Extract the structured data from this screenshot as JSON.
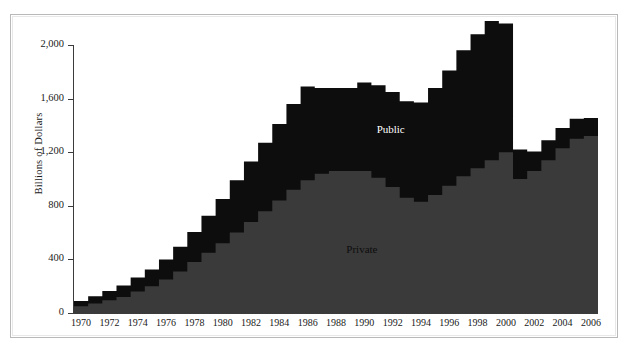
{
  "chart_data": {
    "type": "area",
    "title": "",
    "subtitle": "",
    "xlabel": "",
    "ylabel": "Billions of Dollars",
    "xlim": [
      1970,
      2006
    ],
    "ylim": [
      0,
      2000
    ],
    "grid": false,
    "legend_position": "inline-annotations",
    "stacked": true,
    "step": true,
    "colors": {
      "private": "#3a3a3a",
      "public": "#0d0d0d",
      "axis": "#3b3b3b",
      "background": "#ffffff"
    },
    "annotations": [
      {
        "text": "Public",
        "x": 1992,
        "y": 1360,
        "color": "#ffffff"
      },
      {
        "text": "Private",
        "x": 1990,
        "y": 460,
        "color": "#0d0d0d"
      }
    ],
    "yticks": [
      0,
      400,
      800,
      1200,
      1600,
      2000
    ],
    "ytick_labels": [
      "0",
      "400",
      "800",
      "1,200",
      "1,600",
      "2,000"
    ],
    "xticks": [
      1970,
      1972,
      1974,
      1976,
      1978,
      1980,
      1982,
      1984,
      1986,
      1988,
      1990,
      1992,
      1994,
      1996,
      1998,
      2000,
      2002,
      2004,
      2006
    ],
    "xtick_labels": [
      "1970",
      "1972",
      "1974",
      "1976",
      "1978",
      "1980",
      "1982",
      "1984",
      "1986",
      "1988",
      "1990",
      "1992",
      "1994",
      "1996",
      "1998",
      "2000",
      "2002",
      "2004",
      "2006"
    ],
    "x": [
      1970,
      1971,
      1972,
      1973,
      1974,
      1975,
      1976,
      1977,
      1978,
      1979,
      1980,
      1981,
      1982,
      1983,
      1984,
      1985,
      1986,
      1987,
      1988,
      1989,
      1990,
      1991,
      1992,
      1993,
      1994,
      1995,
      1996,
      1997,
      1998,
      1999,
      2000,
      2001,
      2002,
      2003,
      2004,
      2005,
      2006
    ],
    "series": [
      {
        "name": "Private",
        "values": [
          50,
          70,
          95,
          120,
          160,
          200,
          250,
          310,
          380,
          450,
          520,
          600,
          680,
          760,
          840,
          920,
          990,
          1040,
          1060,
          1060,
          1060,
          1010,
          940,
          860,
          830,
          880,
          950,
          1020,
          1080,
          1140,
          1200,
          1000,
          1060,
          1140,
          1230,
          1300,
          1320
        ]
      },
      {
        "name": "Public",
        "values": [
          40,
          55,
          70,
          85,
          105,
          125,
          150,
          185,
          225,
          275,
          330,
          390,
          450,
          510,
          570,
          640,
          700,
          640,
          620,
          620,
          660,
          690,
          710,
          720,
          740,
          800,
          860,
          940,
          1000,
          1040,
          960,
          220,
          145,
          150,
          150,
          150,
          135
        ]
      }
    ],
    "totals": [
      90,
      125,
      165,
      205,
      265,
      325,
      400,
      495,
      605,
      725,
      850,
      990,
      1130,
      1270,
      1410,
      1560,
      1690,
      1680,
      1680,
      1680,
      1720,
      1700,
      1650,
      1580,
      1570,
      1680,
      1810,
      1960,
      2080,
      2180,
      2160,
      1220,
      1205,
      1290,
      1380,
      1450,
      1455
    ]
  }
}
